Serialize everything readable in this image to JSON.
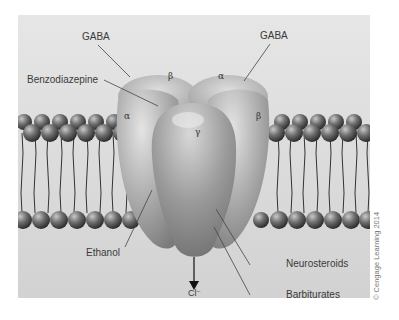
{
  "diagram": {
    "subunits": [
      {
        "id": "alpha-left",
        "label": "α"
      },
      {
        "id": "beta-top-left",
        "label": "β"
      },
      {
        "id": "alpha-top-right",
        "label": "α"
      },
      {
        "id": "gamma-center",
        "label": "γ"
      },
      {
        "id": "beta-right",
        "label": "β"
      }
    ],
    "labels": {
      "gaba_left": "GABA",
      "gaba_right": "GABA",
      "benzodiazepine": "Benzodiazepine",
      "ethanol": "Ethanol",
      "neurosteroids": "Neurosteroids",
      "barbiturates": "Barbiturates",
      "chloride": "Cl⁻"
    },
    "copyright": "© Cengage Learning 2014",
    "colors": {
      "background": "#dcdcdc",
      "protein": "#a8a8a8",
      "lipid_head": "#6a6a6a",
      "leader_line": "#444444"
    }
  }
}
